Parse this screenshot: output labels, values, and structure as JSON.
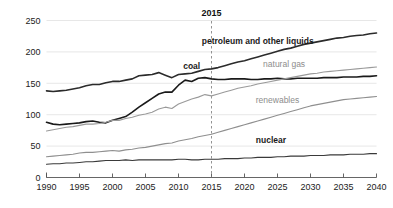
{
  "chart_data": {
    "type": "line",
    "title": "",
    "subtitle": "",
    "xlabel": "",
    "ylabel": "",
    "xlim": [
      1990,
      2040
    ],
    "ylim": [
      0,
      250
    ],
    "xticks": [
      1990,
      1995,
      2000,
      2005,
      2010,
      2015,
      2020,
      2025,
      2030,
      2035,
      2040
    ],
    "yticks": [
      0,
      50,
      100,
      150,
      200,
      250
    ],
    "grid": "horizontal",
    "legend_position": "inline-labels",
    "annotations": [
      {
        "name": "projection-divider",
        "label": "2015",
        "x": 2015,
        "style": "dashed-vertical-line"
      }
    ],
    "x": [
      1990,
      1991,
      1992,
      1993,
      1994,
      1995,
      1996,
      1997,
      1998,
      1999,
      2000,
      2001,
      2002,
      2003,
      2004,
      2005,
      2006,
      2007,
      2008,
      2009,
      2010,
      2011,
      2012,
      2013,
      2014,
      2015,
      2016,
      2017,
      2018,
      2019,
      2020,
      2021,
      2022,
      2023,
      2024,
      2025,
      2026,
      2027,
      2028,
      2029,
      2030,
      2031,
      2032,
      2033,
      2034,
      2035,
      2036,
      2037,
      2038,
      2039,
      2040
    ],
    "series": [
      {
        "name": "petroleum and other liquids",
        "color": "#2b2b2b",
        "label_x": 2022,
        "label_y": 212,
        "values": [
          138,
          137,
          138,
          139,
          141,
          143,
          146,
          148,
          148,
          151,
          153,
          153,
          155,
          157,
          162,
          163,
          164,
          167,
          163,
          159,
          164,
          165,
          166,
          169,
          172,
          173,
          175,
          178,
          181,
          184,
          186,
          189,
          192,
          195,
          198,
          201,
          204,
          206,
          209,
          212,
          214,
          216,
          218,
          220,
          222,
          223,
          225,
          226,
          227,
          229,
          230
        ]
      },
      {
        "name": "coal",
        "color": "#1a1a1a",
        "label_x": 2012,
        "label_y": 172,
        "values": [
          88,
          85,
          84,
          85,
          86,
          87,
          89,
          90,
          88,
          87,
          91,
          94,
          97,
          104,
          112,
          119,
          126,
          133,
          136,
          136,
          147,
          155,
          153,
          158,
          159,
          157,
          156,
          156,
          157,
          157,
          157,
          156,
          156,
          157,
          157,
          158,
          157,
          157,
          158,
          158,
          158,
          158,
          159,
          159,
          159,
          160,
          160,
          160,
          161,
          161,
          162
        ]
      },
      {
        "name": "natural gas",
        "color": "#9a9a9a",
        "label_x": 2026,
        "label_y": 176,
        "values": [
          74,
          76,
          78,
          80,
          81,
          83,
          85,
          85,
          86,
          88,
          91,
          91,
          94,
          96,
          99,
          101,
          104,
          109,
          112,
          110,
          117,
          121,
          125,
          128,
          132,
          130,
          133,
          136,
          139,
          142,
          144,
          146,
          149,
          151,
          153,
          155,
          157,
          159,
          161,
          163,
          165,
          166,
          168,
          169,
          170,
          171,
          172,
          173,
          174,
          175,
          176
        ]
      },
      {
        "name": "renewables",
        "color": "#8f8f8f",
        "label_x": 2025,
        "label_y": 118,
        "values": [
          33,
          34,
          35,
          36,
          37,
          39,
          40,
          40,
          41,
          42,
          43,
          42,
          44,
          45,
          47,
          48,
          50,
          52,
          54,
          55,
          58,
          60,
          62,
          65,
          67,
          69,
          72,
          75,
          78,
          81,
          84,
          87,
          90,
          93,
          96,
          99,
          102,
          105,
          108,
          111,
          114,
          116,
          118,
          120,
          122,
          124,
          125,
          126,
          127,
          128,
          129
        ]
      },
      {
        "name": "nuclear",
        "color": "#3a3a3a",
        "label_x": 2024,
        "label_y": 55,
        "values": [
          21,
          22,
          22,
          23,
          23,
          24,
          25,
          25,
          26,
          27,
          27,
          27,
          28,
          27,
          28,
          28,
          28,
          28,
          28,
          28,
          29,
          29,
          28,
          28,
          29,
          29,
          29,
          30,
          30,
          30,
          31,
          31,
          32,
          32,
          32,
          33,
          33,
          34,
          34,
          34,
          35,
          35,
          35,
          36,
          36,
          36,
          37,
          37,
          37,
          38,
          38
        ]
      }
    ]
  }
}
